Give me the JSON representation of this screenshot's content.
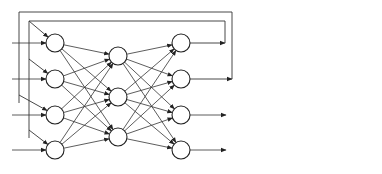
{
  "diagram": {
    "type": "neural-network-with-feedback",
    "colors": {
      "stroke": "#222222",
      "background": "#ffffff"
    },
    "layers": [
      {
        "name": "input",
        "x": 55,
        "nodes_y": [
          43,
          79,
          115,
          150
        ]
      },
      {
        "name": "hidden",
        "x": 118,
        "nodes_y": [
          56,
          97,
          137
        ]
      },
      {
        "name": "output",
        "x": 181,
        "nodes_y": [
          43,
          79,
          115,
          150
        ]
      }
    ],
    "node_radius": 9,
    "external_inputs": 4,
    "outputs": 4,
    "feedback_loops": [
      {
        "from_output": 1,
        "box": {
          "left": 29,
          "top": 21,
          "right": 225
        },
        "feeds_inputs": [
          1,
          2,
          4
        ]
      },
      {
        "from_output": 2,
        "box": {
          "left": 19,
          "top": 12,
          "right": 232
        },
        "feeds_inputs": [
          3
        ]
      }
    ]
  }
}
